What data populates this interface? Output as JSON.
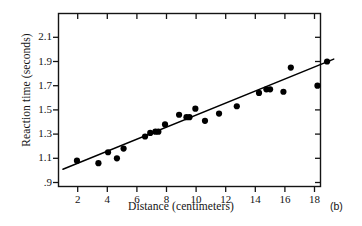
{
  "figure": {
    "panel_label": "(b)"
  },
  "chart_data": {
    "type": "scatter",
    "title": "",
    "xlabel": "Distance (centimeters)",
    "ylabel": "Reaction time (seconds)",
    "xlim": [
      0.7,
      19.5
    ],
    "ylim": [
      0.89,
      2.1
    ],
    "xticks": [
      2,
      4,
      6,
      8,
      10,
      12,
      14,
      16,
      18
    ],
    "xtick_labels": [
      "2",
      "4",
      "6",
      "8",
      "10",
      "12",
      "14",
      "16",
      "18"
    ],
    "yticks": [
      0.9,
      1.1,
      1.3,
      1.5,
      1.7,
      1.9,
      2.1
    ],
    "ytick_labels": [
      ".9",
      "1.1",
      "1.3",
      "1.5",
      "1.7",
      "1.9",
      "2.1"
    ],
    "grid": false,
    "legend": false,
    "tick_direction": "in-and-out",
    "point_color": "#000000",
    "line_color": "#000000",
    "points": [
      {
        "x": 1.95,
        "y": 1.08
      },
      {
        "x": 3.4,
        "y": 1.06
      },
      {
        "x": 4.05,
        "y": 1.15
      },
      {
        "x": 4.65,
        "y": 1.1
      },
      {
        "x": 5.1,
        "y": 1.18
      },
      {
        "x": 6.55,
        "y": 1.28
      },
      {
        "x": 6.9,
        "y": 1.31
      },
      {
        "x": 7.25,
        "y": 1.32
      },
      {
        "x": 7.45,
        "y": 1.32
      },
      {
        "x": 7.9,
        "y": 1.38
      },
      {
        "x": 8.85,
        "y": 1.46
      },
      {
        "x": 9.35,
        "y": 1.44
      },
      {
        "x": 9.55,
        "y": 1.44
      },
      {
        "x": 9.95,
        "y": 1.51
      },
      {
        "x": 10.6,
        "y": 1.41
      },
      {
        "x": 11.55,
        "y": 1.47
      },
      {
        "x": 12.75,
        "y": 1.53
      },
      {
        "x": 14.25,
        "y": 1.64
      },
      {
        "x": 14.75,
        "y": 1.67
      },
      {
        "x": 15.0,
        "y": 1.67
      },
      {
        "x": 15.9,
        "y": 1.65
      },
      {
        "x": 16.4,
        "y": 1.85
      },
      {
        "x": 18.2,
        "y": 1.7
      },
      {
        "x": 18.85,
        "y": 1.9
      }
    ],
    "fit_line": {
      "name": "least-squares regression line",
      "x_start": 1.0,
      "y_start": 1.01,
      "x_end": 19.3,
      "y_end": 1.92
    }
  }
}
